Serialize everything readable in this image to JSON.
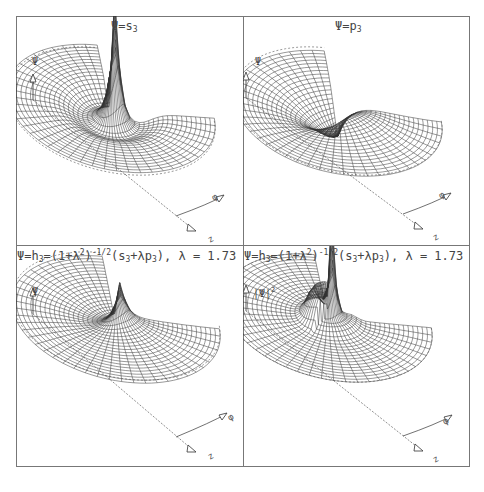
{
  "figure": {
    "panels": [
      {
        "id": "top-left",
        "title": "Ψ=s₃",
        "title_parts": {
          "lhs": "Ψ=s",
          "sub": "3"
        },
        "ylabel": "Ψ",
        "axes": {
          "radial": "z",
          "angular": "φ"
        },
        "surface": "sharp central spike with dip"
      },
      {
        "id": "top-right",
        "title": "Ψ=p₃",
        "title_parts": {
          "lhs": "Ψ=p",
          "sub": "3"
        },
        "ylabel": "Ψ",
        "axes": {
          "radial": "z",
          "angular": "φ"
        },
        "surface": "antisymmetric peak and trough"
      },
      {
        "id": "bottom-left",
        "title": "Ψ=h₃=(1+λ²)^(-1/2)(s₃+λp₃), λ = 1.73",
        "title_parts": {
          "a": "Ψ=h",
          "s1": "3",
          "b": "=(1+λ",
          "e1": "2",
          "c": ")",
          "e2": "-1/2",
          "d": "(s",
          "s2": "3",
          "e": "+λp",
          "s3": "3",
          "f": "),  λ  =  1.73"
        },
        "ylabel": "Ψ",
        "axes": {
          "radial": "z",
          "angular": "φ"
        },
        "surface": "hybrid orbital, ridge and trough"
      },
      {
        "id": "bottom-right",
        "title": "Ψ=h₃=(1+λ²)^(-1/2)(s₃+λp₃), λ = 1.73",
        "title_parts": {
          "a": "Ψ=h",
          "s1": "3",
          "b": "=(1+λ",
          "e1": "2",
          "c": ")",
          "e2": "-1/2",
          "d": "(s",
          "s2": "3",
          "e": "+λp",
          "s3": "3",
          "f": "),  λ  =  1.73"
        },
        "ylabel": "|Ψ|",
        "ylabel_sup": "2",
        "axes": {
          "radial": "z",
          "angular": "φ"
        },
        "surface": "probability density, tall spike with side lobe"
      }
    ],
    "lambda": 1.73,
    "colors": {
      "frame": "#777777",
      "mesh": "#333333",
      "background": "#ffffff"
    }
  }
}
